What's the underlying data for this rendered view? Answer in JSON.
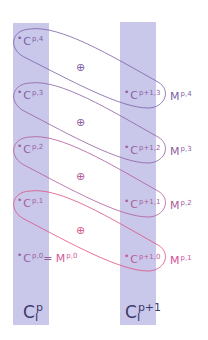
{
  "diagram": {
    "columns": [
      {
        "id": "left",
        "base": "C",
        "sup": "p",
        "sub": "I"
      },
      {
        "id": "right",
        "base": "C",
        "sup": "p+1",
        "sub": "I"
      }
    ],
    "left_nodes": [
      {
        "base": "C",
        "sup": "p,4",
        "color": "#7a5fa6"
      },
      {
        "base": "C",
        "sup": "p,3",
        "color": "#8a5fa4"
      },
      {
        "base": "C",
        "sup": "p,2",
        "color": "#9a5f9e"
      },
      {
        "base": "C",
        "sup": "p,1",
        "color": "#a85f98"
      },
      {
        "base": "C",
        "sup": "p,0",
        "eq": "=",
        "m_base": "M",
        "m_sup": "p,0",
        "color": "#b55f95",
        "m_color": "#d05a9a"
      }
    ],
    "right_nodes": [
      {
        "base": "C",
        "sup": "p+1,3",
        "color": "#8a5fa4"
      },
      {
        "base": "C",
        "sup": "p+1,2",
        "color": "#9a5f9e"
      },
      {
        "base": "C",
        "sup": "p+1,1",
        "color": "#a85f98"
      },
      {
        "base": "C",
        "sup": "p+1,0",
        "color": "#c05a98"
      }
    ],
    "m_labels": [
      {
        "base": "M",
        "sup": "p,4",
        "color": "#7a5fa6"
      },
      {
        "base": "M",
        "sup": "p,3",
        "color": "#8e5fa2"
      },
      {
        "base": "M",
        "sup": "p,2",
        "color": "#a85f98"
      },
      {
        "base": "M",
        "sup": "p,1",
        "color": "#d4509a"
      }
    ],
    "operator_symbol": "⊕",
    "operators": [
      {
        "color": "#7a5fa6"
      },
      {
        "color": "#8e5fa2"
      },
      {
        "color": "#b05a9a"
      },
      {
        "color": "#dd5a8a"
      }
    ],
    "loops": [
      {
        "from": "C^{p,4}",
        "to": "C^{p+1,3}",
        "label": "M^{p,4}",
        "color": "#7a5fa6"
      },
      {
        "from": "C^{p,3}",
        "to": "C^{p+1,2}",
        "label": "M^{p,3}",
        "color": "#8e5fa2"
      },
      {
        "from": "C^{p,2}",
        "to": "C^{p+1,1}",
        "label": "M^{p,2}",
        "color": "#b05a9a"
      },
      {
        "from": "C^{p,1}",
        "to": "C^{p+1,0}",
        "label": "M^{p,1}",
        "color": "#dd4f80"
      }
    ],
    "band_color": "#c9c8eb",
    "dot": "•"
  }
}
